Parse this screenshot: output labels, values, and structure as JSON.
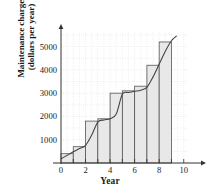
{
  "chart_data": {
    "type": "bar",
    "title": "",
    "xlabel": "Year",
    "ylabel": "Maintenance charges (dollars per year)",
    "ylabel_lines": [
      "Maintenance charges",
      "(dollars per year)"
    ],
    "xlim": [
      0,
      11
    ],
    "ylim": [
      0,
      5800
    ],
    "x_ticks": [
      0,
      2,
      4,
      6,
      8,
      10
    ],
    "x_tick_labels": [
      "0",
      "2",
      "4",
      "6",
      "8",
      "10"
    ],
    "x_minor_ticks": [
      1,
      3,
      5,
      7,
      9
    ],
    "y_ticks": [
      1000,
      2000,
      3000,
      4000,
      5000
    ],
    "y_tick_labels": [
      "1000",
      "2000",
      "3000",
      "4000",
      "5000"
    ],
    "grid": true,
    "grid_style": "dotted",
    "grid_x_step": 0.5,
    "grid_y_step": 500,
    "bar_fill": "#e8e8e8",
    "bar_edge": "#555555",
    "curve_color": "#444444",
    "axis_color": "#333333",
    "grid_color": "#c9c9d6",
    "bars": [
      {
        "x_start": 0,
        "x_end": 1,
        "value": 400
      },
      {
        "x_start": 1,
        "x_end": 2,
        "value": 700
      },
      {
        "x_start": 2,
        "x_end": 3,
        "value": 1800
      },
      {
        "x_start": 3,
        "x_end": 4,
        "value": 1900
      },
      {
        "x_start": 4,
        "x_end": 5,
        "value": 3000
      },
      {
        "x_start": 5,
        "x_end": 6,
        "value": 3100
      },
      {
        "x_start": 6,
        "x_end": 7,
        "value": 3300
      },
      {
        "x_start": 7,
        "x_end": 8,
        "value": 4200
      },
      {
        "x_start": 8,
        "x_end": 9,
        "value": 5200
      }
    ],
    "categories": [
      "0-1",
      "1-2",
      "2-3",
      "3-4",
      "4-5",
      "5-6",
      "6-7",
      "7-8",
      "8-9"
    ],
    "values": [
      400,
      700,
      1800,
      1900,
      3000,
      3100,
      3300,
      4200,
      5200
    ],
    "curve": {
      "name": "maintenance charge rate",
      "x": [
        0,
        0.5,
        1,
        1.5,
        2,
        2.5,
        3,
        3.5,
        4,
        4.5,
        5,
        5.5,
        6,
        6.5,
        7,
        7.5,
        8,
        8.5,
        9,
        9.4
      ],
      "y": [
        180,
        330,
        480,
        620,
        760,
        1200,
        1760,
        1850,
        1900,
        2100,
        2950,
        3030,
        3080,
        3130,
        3250,
        3700,
        4250,
        4800,
        5250,
        5450
      ]
    }
  }
}
